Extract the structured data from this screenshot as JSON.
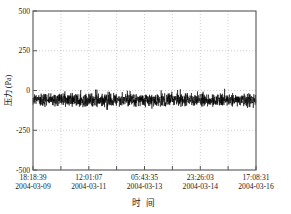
{
  "chart_data": {
    "type": "line",
    "title": "",
    "xlabel": "时 间",
    "ylabel": "压力 (Pa)",
    "ylim": [
      -500,
      500
    ],
    "yticks": [
      -500,
      -250,
      0,
      250,
      500
    ],
    "ytick_labels": [
      "-500",
      "-250",
      "0",
      "250",
      "500"
    ],
    "grid": true,
    "grid_style": "dotted",
    "legend": "none",
    "x_major_count": 5,
    "x_minor_divisions": 8,
    "xtick_labels": [
      {
        "time": "18:18:39",
        "date": "2004-03-09"
      },
      {
        "time": "12:01:07",
        "date": "2004-03-11"
      },
      {
        "time": "05:43:35",
        "date": "2004-03-13"
      },
      {
        "time": "23:26:03",
        "date": "2004-03-14"
      },
      {
        "time": "17:08:31",
        "date": "2004-03-16"
      }
    ],
    "series": [
      {
        "name": "压力",
        "color": "#000000",
        "mean": -60,
        "noise_amplitude": 38,
        "description": "Dense high-frequency pressure noise trace centered near -60 Pa, spanning the full time window with no trend.",
        "n_points": 1400
      }
    ]
  },
  "colors": {
    "axis": "#555555",
    "grid": "#bbbbbb",
    "trace": "#000000",
    "text": "#1a1a1a",
    "background": "#ffffff"
  }
}
